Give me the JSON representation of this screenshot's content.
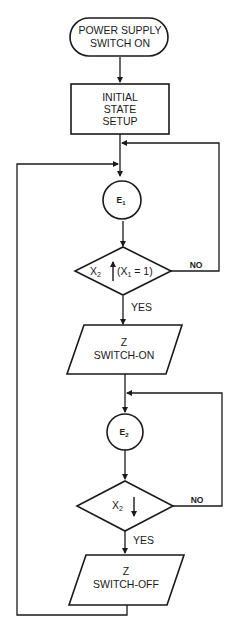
{
  "flowchart": {
    "start": {
      "line1": "POWER SUPPLY",
      "line2": "SWITCH ON"
    },
    "init": {
      "line1": "INITIAL",
      "line2": "STATE",
      "line3": "SETUP"
    },
    "event1": {
      "label": "E",
      "sub": "1"
    },
    "decision1": {
      "var": "X",
      "var_sub": "2",
      "edge": "rising",
      "cond": "(X",
      "cond_sub": "1",
      "cond_rest": " = 1)",
      "yes": "YES",
      "no": "NO"
    },
    "output1": {
      "line1": "Z",
      "line2": "SWITCH-ON"
    },
    "event2": {
      "label": "E",
      "sub": "2"
    },
    "decision2": {
      "var": "X",
      "var_sub": "2",
      "edge": "falling",
      "yes": "YES",
      "no": "NO"
    },
    "output2": {
      "line1": "Z",
      "line2": "SWITCH-OFF"
    }
  },
  "colors": {
    "stroke": "#1a1a1a",
    "background": "#ffffff"
  }
}
